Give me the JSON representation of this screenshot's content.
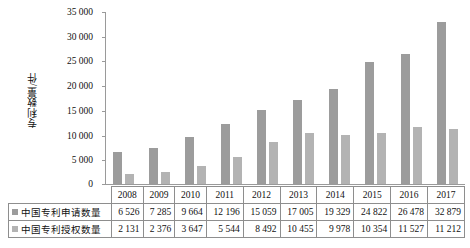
{
  "chart_data": {
    "type": "bar",
    "title": "",
    "xlabel": "",
    "ylabel": "专利数量/件",
    "categories": [
      "2008",
      "2009",
      "2010",
      "2011",
      "2012",
      "2013",
      "2014",
      "2015",
      "2016",
      "2017"
    ],
    "series": [
      {
        "name": "中国专利申请数量",
        "color": "#9c9c9c",
        "values": [
          6526,
          7285,
          9664,
          12196,
          15059,
          17005,
          19329,
          24822,
          26478,
          32879
        ],
        "labels": [
          "6 526",
          "7 285",
          "9 664",
          "12 196",
          "15 059",
          "17 005",
          "19 329",
          "24 822",
          "26 478",
          "32 879"
        ]
      },
      {
        "name": "中国专利授权数量",
        "color": "#b3b3b3",
        "values": [
          2131,
          2376,
          3647,
          5544,
          8492,
          10455,
          9978,
          10354,
          11527,
          11212
        ],
        "labels": [
          "2 131",
          "2 376",
          "3 647",
          "5 544",
          "8 492",
          "10 455",
          "9 978",
          "10 354",
          "11 527",
          "11 212"
        ]
      }
    ],
    "ylim": [
      0,
      35000
    ],
    "yticks": [
      0,
      5000,
      10000,
      15000,
      20000,
      25000,
      30000,
      35000
    ],
    "ytick_labels": [
      "0",
      "5 000",
      "10 000",
      "15 000",
      "20 000",
      "25 000",
      "30 000",
      "35 000"
    ],
    "grid": false,
    "legend_position": "table-row-headers"
  }
}
